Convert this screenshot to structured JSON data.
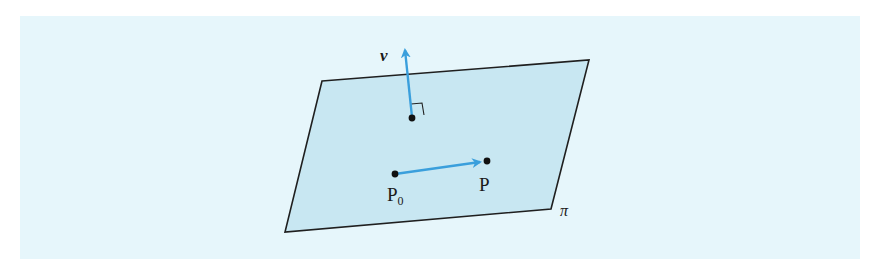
{
  "figure": {
    "type": "plane-with-normal-vector",
    "colors": {
      "panel_background": "#e6f6fb",
      "plane_fill": "#c8e7f2",
      "plane_edge": "#1f1f1f",
      "vector": "#3a9fdc",
      "point": "#111111"
    },
    "plane": {
      "label": "π",
      "corners": [
        [
          322,
          81
        ],
        [
          589,
          60
        ],
        [
          551,
          209
        ],
        [
          285,
          232
        ]
      ]
    },
    "normal_vector": {
      "label": "v",
      "from": [
        412,
        117
      ],
      "to": [
        405,
        48
      ]
    },
    "points": [
      {
        "id": "P0",
        "label": "P",
        "subscript": "0",
        "x": 395,
        "y": 174
      },
      {
        "id": "P",
        "label": "P",
        "subscript": "",
        "x": 487,
        "y": 161
      }
    ],
    "in_plane_vector": {
      "from": "P0",
      "to": "P"
    }
  }
}
